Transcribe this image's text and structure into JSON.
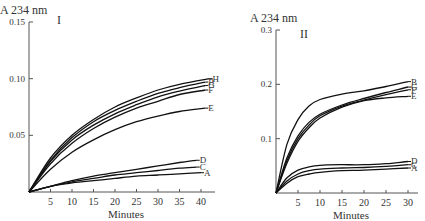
{
  "chart_data": [
    {
      "type": "line",
      "panel_label": "I",
      "title": "",
      "ylabel": "A 234 nm",
      "xlabel": "Minutes",
      "xlim": [
        0,
        42
      ],
      "ylim": [
        0,
        0.15
      ],
      "xticks": [
        5,
        10,
        15,
        20,
        25,
        30,
        35,
        40
      ],
      "yticks": [
        0.05,
        0.1,
        0.15
      ],
      "ytick_labels": [
        "0.05",
        "0.10",
        "0.15"
      ],
      "grid": false,
      "legend": "inline labels at curve ends",
      "series": [
        {
          "name": "H",
          "x": [
            0,
            5,
            10,
            15,
            20,
            25,
            30,
            35,
            42
          ],
          "values": [
            0,
            0.03,
            0.05,
            0.064,
            0.075,
            0.083,
            0.09,
            0.095,
            0.1
          ]
        },
        {
          "name": "B",
          "x": [
            0,
            5,
            10,
            15,
            20,
            25,
            30,
            35,
            41
          ],
          "values": [
            0,
            0.028,
            0.048,
            0.062,
            0.072,
            0.08,
            0.087,
            0.092,
            0.097
          ]
        },
        {
          "name": "G",
          "x": [
            0,
            5,
            10,
            15,
            20,
            25,
            30,
            35,
            41
          ],
          "values": [
            0,
            0.027,
            0.046,
            0.059,
            0.069,
            0.077,
            0.084,
            0.089,
            0.094
          ]
        },
        {
          "name": "F",
          "x": [
            0,
            5,
            10,
            15,
            20,
            25,
            30,
            35,
            41
          ],
          "values": [
            0,
            0.025,
            0.043,
            0.056,
            0.066,
            0.074,
            0.08,
            0.086,
            0.09
          ]
        },
        {
          "name": "E",
          "x": [
            0,
            5,
            10,
            15,
            20,
            25,
            30,
            35,
            41
          ],
          "values": [
            0,
            0.02,
            0.035,
            0.046,
            0.055,
            0.062,
            0.067,
            0.071,
            0.074
          ]
        },
        {
          "name": "D",
          "x": [
            0,
            5,
            10,
            15,
            20,
            25,
            30,
            35,
            39
          ],
          "values": [
            0,
            0.005,
            0.01,
            0.014,
            0.017,
            0.02,
            0.023,
            0.026,
            0.028
          ]
        },
        {
          "name": "C",
          "x": [
            0,
            5,
            10,
            15,
            20,
            25,
            30,
            35,
            39
          ],
          "values": [
            0,
            0.005,
            0.009,
            0.012,
            0.015,
            0.017,
            0.019,
            0.021,
            0.022
          ]
        },
        {
          "name": "A",
          "x": [
            0,
            5,
            10,
            15,
            20,
            25,
            30,
            35,
            40
          ],
          "values": [
            0,
            0.005,
            0.008,
            0.01,
            0.012,
            0.014,
            0.015,
            0.016,
            0.017
          ]
        }
      ]
    },
    {
      "type": "line",
      "panel_label": "II",
      "title": "",
      "ylabel": "A 234 nm",
      "xlabel": "Minutes",
      "xlim": [
        0,
        31
      ],
      "ylim": [
        0,
        0.3
      ],
      "xticks": [
        5,
        10,
        15,
        20,
        25,
        30
      ],
      "yticks": [
        0.1,
        0.2,
        0.3
      ],
      "ytick_labels": [
        "0.1",
        "0.2",
        "0.3"
      ],
      "grid": false,
      "legend": "inline labels at curve ends",
      "series": [
        {
          "name": "B",
          "x": [
            0,
            2.5,
            5,
            7.5,
            10,
            15,
            20,
            25,
            30
          ],
          "values": [
            0,
            0.09,
            0.135,
            0.16,
            0.172,
            0.182,
            0.188,
            0.196,
            0.205
          ]
        },
        {
          "name": "G",
          "x": [
            0,
            2.5,
            5,
            7.5,
            10,
            15,
            20,
            25,
            30
          ],
          "values": [
            0,
            0.065,
            0.105,
            0.13,
            0.145,
            0.162,
            0.174,
            0.185,
            0.195
          ]
        },
        {
          "name": "F",
          "x": [
            0,
            2.5,
            5,
            7.5,
            10,
            15,
            20,
            25,
            30
          ],
          "values": [
            0,
            0.06,
            0.1,
            0.125,
            0.142,
            0.16,
            0.171,
            0.181,
            0.19
          ]
        },
        {
          "name": "E",
          "x": [
            0,
            2.5,
            5,
            7.5,
            10,
            15,
            20,
            25,
            30
          ],
          "values": [
            0,
            0.055,
            0.095,
            0.12,
            0.138,
            0.158,
            0.17,
            0.175,
            0.178
          ]
        },
        {
          "name": "D",
          "x": [
            0,
            2.5,
            5,
            7.5,
            10,
            15,
            20,
            25,
            30
          ],
          "values": [
            0,
            0.028,
            0.042,
            0.048,
            0.051,
            0.052,
            0.052,
            0.054,
            0.058
          ]
        },
        {
          "name": "C",
          "x": [
            0,
            2.5,
            5,
            7.5,
            10,
            15,
            20,
            25,
            30
          ],
          "values": [
            0,
            0.022,
            0.035,
            0.041,
            0.044,
            0.046,
            0.047,
            0.049,
            0.052
          ]
        },
        {
          "name": "A",
          "x": [
            0,
            2.5,
            5,
            7.5,
            10,
            15,
            20,
            25,
            30
          ],
          "values": [
            0,
            0.018,
            0.03,
            0.035,
            0.038,
            0.041,
            0.042,
            0.044,
            0.046
          ]
        }
      ]
    }
  ]
}
